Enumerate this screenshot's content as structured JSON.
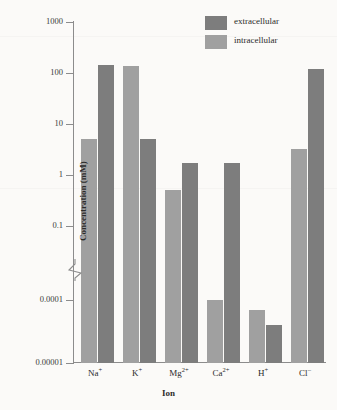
{
  "chart_data": {
    "type": "bar",
    "title": "",
    "xlabel": "Ion",
    "ylabel": "Concentration (mM)",
    "scale": "log",
    "ylim": [
      1e-05,
      1000
    ],
    "axis_break": {
      "between": [
        0.1,
        0.0001
      ],
      "symbol": "zigzag"
    },
    "grid": false,
    "legend_position": "top-right",
    "categories": [
      "Na+",
      "K+",
      "Mg2+",
      "Ca2+",
      "H+",
      "Cl-"
    ],
    "category_labels": [
      {
        "base": "Na",
        "sup": "+"
      },
      {
        "base": "K",
        "sup": "+"
      },
      {
        "base": "Mg",
        "sup": "2+"
      },
      {
        "base": "Ca",
        "sup": "2+"
      },
      {
        "base": "H",
        "sup": "+"
      },
      {
        "base": "Cl",
        "sup": "–"
      }
    ],
    "ytick_labels": [
      "1000",
      "100",
      "10",
      "1",
      "0.1",
      "0.0001",
      "0.00001"
    ],
    "ytick_values": [
      1000,
      100,
      10,
      1,
      0.1,
      0.0001,
      1e-05
    ],
    "series": [
      {
        "name": "intracellular",
        "color": "#a0a0a0",
        "values": [
          5.0,
          140.0,
          0.5,
          0.0001,
          7e-05,
          3.2
        ]
      },
      {
        "name": "extracellular",
        "color": "#7d7d7d",
        "values": [
          145.0,
          5.0,
          1.7,
          1.7,
          4e-05,
          120.0
        ]
      }
    ]
  },
  "legend": {
    "items": [
      {
        "label": "extracellular",
        "color": "#7d7d7d"
      },
      {
        "label": "intracellular",
        "color": "#a0a0a0"
      }
    ]
  },
  "axes": {
    "x_title": "Ion",
    "y_title": "Concentration (mM)"
  },
  "colors": {
    "background": "#fbfaf8",
    "axis": "#8c8c8c",
    "text": "#2b2b2b",
    "extracellular": "#7d7d7d",
    "intracellular": "#a0a0a0"
  }
}
